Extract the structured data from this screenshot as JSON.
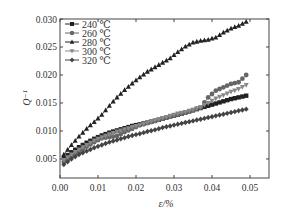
{
  "chart_data": {
    "type": "line",
    "title": "",
    "xlabel": "ε/%",
    "ylabel": "Q⁻¹",
    "xlim": [
      0.0,
      0.055
    ],
    "ylim": [
      0.0016,
      0.03
    ],
    "xticks": [
      "0.00",
      "0.01",
      "0.02",
      "0.03",
      "0.04",
      "0.05"
    ],
    "xtick_values": [
      0.0,
      0.01,
      0.02,
      0.03,
      0.04,
      0.05
    ],
    "yticks": [
      "0.005",
      "0.010",
      "0.015",
      "0.020",
      "0.025",
      "0.030"
    ],
    "ytick_values": [
      0.005,
      0.01,
      0.015,
      0.02,
      0.025,
      0.03
    ],
    "grid": false,
    "legend_position": "upper left",
    "series": [
      {
        "name": "240 ℃",
        "marker": "square",
        "color": "#222222",
        "x": [
          0.001,
          0.003,
          0.005,
          0.007,
          0.009,
          0.011,
          0.013,
          0.015,
          0.017,
          0.019,
          0.021,
          0.023,
          0.025,
          0.027,
          0.029,
          0.031,
          0.033,
          0.035,
          0.037,
          0.039,
          0.041,
          0.043,
          0.045,
          0.047,
          0.049
        ],
        "y": [
          0.0052,
          0.0062,
          0.0071,
          0.0079,
          0.0086,
          0.0092,
          0.0097,
          0.0101,
          0.0105,
          0.0109,
          0.0112,
          0.0115,
          0.0118,
          0.0122,
          0.0126,
          0.0129,
          0.0133,
          0.0137,
          0.0141,
          0.0145,
          0.0149,
          0.0153,
          0.0157,
          0.016,
          0.0163
        ]
      },
      {
        "name": "260 ℃",
        "marker": "circle",
        "color": "#666666",
        "x": [
          0.001,
          0.003,
          0.005,
          0.007,
          0.009,
          0.011,
          0.013,
          0.015,
          0.017,
          0.019,
          0.021,
          0.023,
          0.025,
          0.027,
          0.029,
          0.031,
          0.033,
          0.035,
          0.037,
          0.039,
          0.041,
          0.043,
          0.045,
          0.047,
          0.049
        ],
        "y": [
          0.0045,
          0.0055,
          0.0063,
          0.0072,
          0.008,
          0.0087,
          0.0089,
          0.0091,
          0.0098,
          0.0104,
          0.011,
          0.0114,
          0.0118,
          0.0122,
          0.0126,
          0.0129,
          0.0133,
          0.0137,
          0.0142,
          0.016,
          0.0172,
          0.0178,
          0.0184,
          0.0187,
          0.02
        ]
      },
      {
        "name": "280 ℃",
        "marker": "triangle-up",
        "color": "#222222",
        "x": [
          0.001,
          0.003,
          0.005,
          0.007,
          0.009,
          0.011,
          0.013,
          0.015,
          0.017,
          0.019,
          0.021,
          0.023,
          0.025,
          0.027,
          0.029,
          0.031,
          0.033,
          0.035,
          0.037,
          0.039,
          0.041,
          0.043,
          0.045,
          0.047,
          0.049
        ],
        "y": [
          0.0058,
          0.0075,
          0.009,
          0.0104,
          0.0116,
          0.0129,
          0.0145,
          0.016,
          0.0173,
          0.0185,
          0.0196,
          0.0206,
          0.0214,
          0.0222,
          0.023,
          0.0241,
          0.0251,
          0.0258,
          0.0261,
          0.0263,
          0.0267,
          0.0276,
          0.0283,
          0.0288,
          0.0295
        ]
      },
      {
        "name": "300 ℃",
        "marker": "triangle-down",
        "color": "#888888",
        "x": [
          0.001,
          0.003,
          0.005,
          0.007,
          0.009,
          0.011,
          0.013,
          0.015,
          0.017,
          0.019,
          0.021,
          0.023,
          0.025,
          0.027,
          0.029,
          0.031,
          0.033,
          0.035,
          0.037,
          0.039,
          0.041,
          0.043,
          0.045,
          0.047,
          0.049
        ],
        "y": [
          0.0048,
          0.0058,
          0.0067,
          0.0075,
          0.0083,
          0.0089,
          0.0094,
          0.0099,
          0.0103,
          0.0107,
          0.0111,
          0.0115,
          0.0119,
          0.0123,
          0.0127,
          0.0131,
          0.0134,
          0.0138,
          0.0143,
          0.015,
          0.0158,
          0.0164,
          0.017,
          0.0175,
          0.0182
        ]
      },
      {
        "name": "320 ℃",
        "marker": "diamond",
        "color": "#444444",
        "x": [
          0.001,
          0.003,
          0.005,
          0.007,
          0.009,
          0.011,
          0.013,
          0.015,
          0.017,
          0.019,
          0.021,
          0.023,
          0.025,
          0.027,
          0.029,
          0.031,
          0.033,
          0.035,
          0.037,
          0.039,
          0.041,
          0.043,
          0.045,
          0.047,
          0.049
        ],
        "y": [
          0.004,
          0.005,
          0.0058,
          0.0064,
          0.007,
          0.0075,
          0.008,
          0.0084,
          0.0088,
          0.0092,
          0.0095,
          0.0099,
          0.0102,
          0.0106,
          0.0109,
          0.0112,
          0.0115,
          0.0118,
          0.0121,
          0.0124,
          0.0127,
          0.013,
          0.0133,
          0.0136,
          0.0139
        ]
      }
    ]
  }
}
